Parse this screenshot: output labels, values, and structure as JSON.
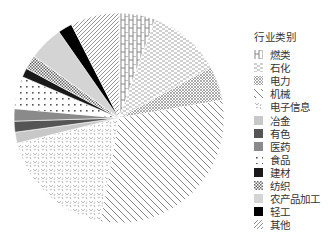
{
  "chart_data": {
    "type": "pie",
    "title": "",
    "legend_title": "行业类别",
    "legend_position": "right",
    "start_angle_deg": 0,
    "direction": "clockwise",
    "unit": "percent (estimated from slice angles)",
    "categories": [
      "燃类",
      "石化",
      "电力",
      "机械",
      "电子信息",
      "冶金",
      "有色",
      "医药",
      "食品",
      "建材",
      "纺织",
      "农产品加工",
      "轻工",
      "其他"
    ],
    "values": [
      5.6,
      11.4,
      5.3,
      30.6,
      18.3,
      1.7,
      1.7,
      1.9,
      5.0,
      1.4,
      2.2,
      5.3,
      2.2,
      7.5
    ],
    "fills": [
      "hatch-H",
      "hatch-dashes",
      "hatch-crosshatch",
      "hatch-backslash",
      "hatch-scatter",
      "#c8c8c8",
      "#555555",
      "#8a8a8a",
      "hatch-dots",
      "#1a1a1a",
      "hatch-checker",
      "#d4d4d4",
      "#000000",
      "hatch-slash"
    ]
  },
  "legend": {
    "title": "行业类别",
    "items": [
      {
        "label": "燃类",
        "icon": "H"
      },
      {
        "label": "石化",
        "icon": "dashes"
      },
      {
        "label": "电力",
        "icon": "crosshatch"
      },
      {
        "label": "机械",
        "icon": "backslash"
      },
      {
        "label": "电子信息",
        "icon": "scatter"
      },
      {
        "label": "冶金",
        "icon": "light-gray"
      },
      {
        "label": "有色",
        "icon": "dark-gray"
      },
      {
        "label": "医药",
        "icon": "gray"
      },
      {
        "label": "食品",
        "icon": "dots"
      },
      {
        "label": "建材",
        "icon": "near-black"
      },
      {
        "label": "纺织",
        "icon": "checker"
      },
      {
        "label": "农产品加工",
        "icon": "pale-gray"
      },
      {
        "label": "轻工",
        "icon": "black"
      },
      {
        "label": "其他",
        "icon": "slash"
      }
    ]
  }
}
